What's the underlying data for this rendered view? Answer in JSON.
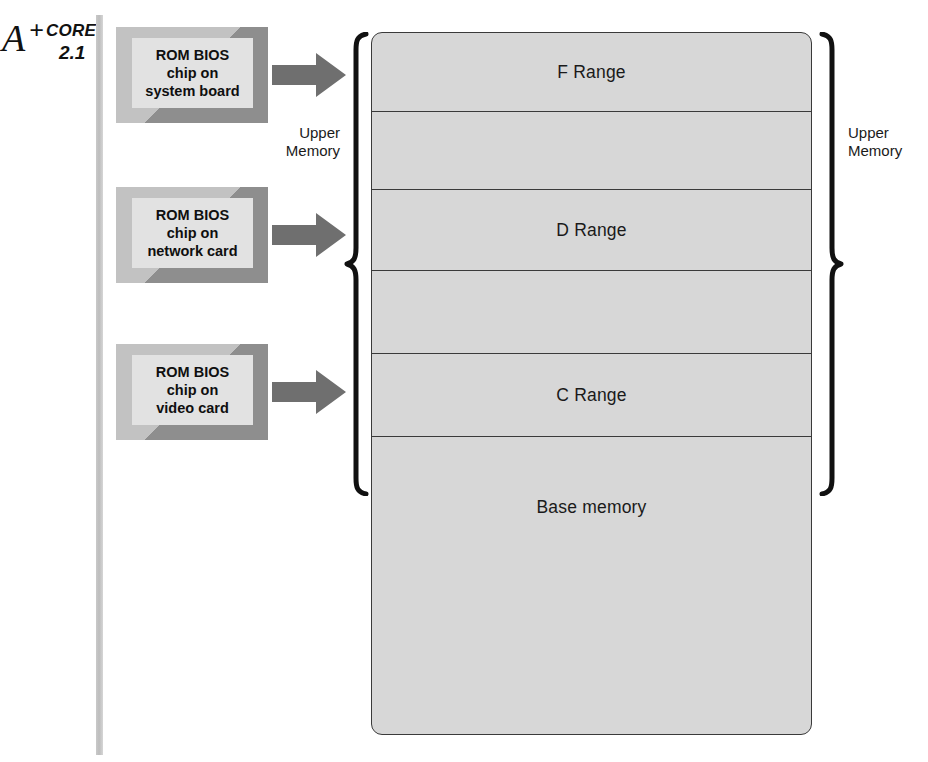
{
  "figure": {
    "core_marker": {
      "letter": "A",
      "plus": "+",
      "word": "CORE",
      "number": "2.1"
    },
    "chips": [
      {
        "name": "rom-bios-system-board",
        "lines": [
          "ROM BIOS",
          "chip on",
          "system board"
        ],
        "x": 116,
        "y": 27,
        "arrow": {
          "x": 272,
          "y": 52
        }
      },
      {
        "name": "rom-bios-network-card",
        "lines": [
          "ROM BIOS",
          "chip on",
          "network card"
        ],
        "x": 116,
        "y": 187,
        "arrow": {
          "x": 272,
          "y": 212
        }
      },
      {
        "name": "rom-bios-video-card",
        "lines": [
          "ROM BIOS",
          "chip on",
          "video card"
        ],
        "x": 116,
        "y": 344,
        "arrow": {
          "x": 272,
          "y": 369
        }
      }
    ],
    "memory_map": {
      "segments": [
        {
          "name": "f-range",
          "label": "F Range",
          "top": 0,
          "height": 79,
          "divider": true
        },
        {
          "name": "gap-upper-1",
          "label": "",
          "top": 79,
          "height": 78,
          "divider": true
        },
        {
          "name": "d-range",
          "label": "D Range",
          "top": 157,
          "height": 81,
          "divider": true
        },
        {
          "name": "gap-upper-2",
          "label": "",
          "top": 238,
          "height": 83,
          "divider": true
        },
        {
          "name": "c-range",
          "label": "C Range",
          "top": 321,
          "height": 83,
          "divider": true
        },
        {
          "name": "base-memory",
          "label": "Base memory",
          "top": 404,
          "height": 298,
          "divider": false
        }
      ],
      "base_memory_label_offset": 60
    },
    "brackets": [
      {
        "name": "upper-memory-left",
        "side": "left",
        "label": [
          "Upper",
          "Memory"
        ],
        "x": 344,
        "y": 32,
        "height": 464,
        "label_x": 282,
        "label_y": 124,
        "label_width": 58
      },
      {
        "name": "upper-memory-right",
        "side": "right",
        "label": [
          "Upper",
          "Memory"
        ],
        "x": 818,
        "y": 32,
        "height": 464,
        "label_x": 848,
        "label_y": 124,
        "label_width": 70
      }
    ],
    "colors": {
      "map_fill": "#d7d7d7",
      "map_stroke": "#3a3a3a",
      "chip_face": "#e2e2e2",
      "chip_bevel_light": "#c2c2c2",
      "chip_bevel_dark": "#8e8e8e",
      "arrow_fill": "#6f6f6f",
      "rule": "#c3c3c3"
    }
  }
}
